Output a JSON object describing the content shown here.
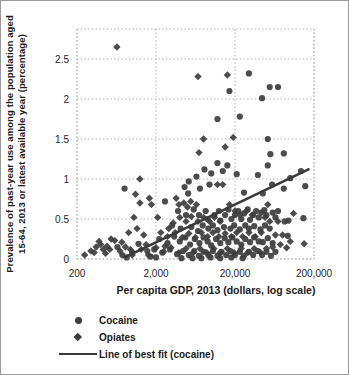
{
  "chart_data": {
    "type": "scatter",
    "title": "",
    "xlabel": "Per capita GDP, 2013 (dollars, log scale)",
    "ylabel_line1": "Prevalence of past-year use among the population aged",
    "ylabel_line2": "15-64, 2013 or latest available year (percentage)",
    "x_scale": "log",
    "xlim": [
      200,
      200000
    ],
    "ylim": [
      0,
      2.875
    ],
    "x_ticks": [
      200,
      2000,
      20000,
      200000
    ],
    "x_tick_labels": [
      "200",
      "2,000",
      "20,000",
      "200,000"
    ],
    "y_ticks": [
      0,
      0.5,
      1,
      1.5,
      2,
      2.5
    ],
    "y_tick_labels": [
      "0",
      "0.5",
      "1",
      "1.5",
      "2",
      "2.5"
    ],
    "grid": "dotted",
    "legend": [
      "Cocaine",
      "Opiates",
      "Line of best fit (cocaine)"
    ],
    "legend_position": "bottom-left",
    "colors": {
      "marker": "#3d3d3d",
      "grid": "#b3b3b3",
      "text": "#262626",
      "line": "#3a3a3a"
    },
    "best_fit_cocaine": {
      "x1": 800,
      "y1": 0.02,
      "x2": 170000,
      "y2": 1.12
    },
    "series": [
      {
        "name": "Cocaine",
        "marker": "circle",
        "points": [
          [
            17000,
            2.1
          ],
          [
            30000,
            2.32
          ],
          [
            44000,
            2.01
          ],
          [
            55000,
            2.15
          ],
          [
            70000,
            2.15
          ],
          [
            23000,
            1.78
          ],
          [
            12000,
            1.75
          ],
          [
            52000,
            1.5
          ],
          [
            56000,
            1.31
          ],
          [
            83000,
            1.32
          ],
          [
            52000,
            1.17
          ],
          [
            39000,
            1.05
          ],
          [
            21000,
            1.06
          ],
          [
            12000,
            1.2
          ],
          [
            16000,
            1.17
          ],
          [
            10000,
            1.07
          ],
          [
            6500,
            1.03
          ],
          [
            5200,
            0.97
          ],
          [
            8200,
            1.12
          ],
          [
            14000,
            1.1
          ],
          [
            100000,
            1.01
          ],
          [
            137000,
            1.1
          ],
          [
            155000,
            0.91
          ],
          [
            83000,
            0.88
          ],
          [
            95000,
            0.48
          ],
          [
            147000,
            0.51
          ],
          [
            93000,
            0.29
          ],
          [
            59000,
            0.93
          ],
          [
            45000,
            0.82
          ],
          [
            26000,
            0.83
          ],
          [
            800,
            0.88
          ],
          [
            4600,
            0.9
          ],
          [
            5100,
            0.82
          ],
          [
            7200,
            0.88
          ],
          [
            9500,
            0.93
          ],
          [
            85000,
            0.47
          ],
          [
            2600,
            0.72
          ],
          [
            3800,
            0.6
          ],
          [
            4800,
            0.55
          ],
          [
            6000,
            0.62
          ],
          [
            7000,
            0.55
          ],
          [
            8500,
            0.6
          ],
          [
            9000,
            0.5
          ],
          [
            11000,
            0.55
          ],
          [
            12500,
            0.6
          ],
          [
            13000,
            0.48
          ],
          [
            15000,
            0.55
          ],
          [
            16500,
            0.62
          ],
          [
            18000,
            0.5
          ],
          [
            20000,
            0.55
          ],
          [
            22000,
            0.6
          ],
          [
            24000,
            0.5
          ],
          [
            26000,
            0.57
          ],
          [
            29000,
            0.62
          ],
          [
            31000,
            0.49
          ],
          [
            34000,
            0.55
          ],
          [
            37000,
            0.6
          ],
          [
            40000,
            0.52
          ],
          [
            43000,
            0.58
          ],
          [
            47000,
            0.61
          ],
          [
            50000,
            0.55
          ],
          [
            60000,
            0.58
          ],
          [
            65000,
            0.52
          ],
          [
            70000,
            0.6
          ],
          [
            3200,
            0.42
          ],
          [
            4100,
            0.38
          ],
          [
            5600,
            0.4
          ],
          [
            6800,
            0.35
          ],
          [
            7800,
            0.42
          ],
          [
            9200,
            0.38
          ],
          [
            10500,
            0.42
          ],
          [
            12000,
            0.36
          ],
          [
            14500,
            0.4
          ],
          [
            17500,
            0.38
          ],
          [
            19500,
            0.42
          ],
          [
            23000,
            0.37
          ],
          [
            27000,
            0.42
          ],
          [
            30000,
            0.38
          ],
          [
            35000,
            0.41
          ],
          [
            42000,
            0.37
          ],
          [
            48000,
            0.42
          ],
          [
            55000,
            0.38
          ],
          [
            2200,
            0.25
          ],
          [
            2800,
            0.2
          ],
          [
            3400,
            0.28
          ],
          [
            4000,
            0.22
          ],
          [
            4700,
            0.27
          ],
          [
            5400,
            0.18
          ],
          [
            6200,
            0.25
          ],
          [
            7100,
            0.2
          ],
          [
            8000,
            0.27
          ],
          [
            9000,
            0.22
          ],
          [
            10000,
            0.17
          ],
          [
            11500,
            0.25
          ],
          [
            13000,
            0.2
          ],
          [
            14800,
            0.26
          ],
          [
            16500,
            0.21
          ],
          [
            18500,
            0.27
          ],
          [
            21000,
            0.22
          ],
          [
            24000,
            0.18
          ],
          [
            27000,
            0.25
          ],
          [
            31000,
            0.21
          ],
          [
            35000,
            0.27
          ],
          [
            40000,
            0.22
          ],
          [
            45000,
            0.21
          ],
          [
            52000,
            0.26
          ],
          [
            60000,
            0.2
          ],
          [
            1900,
            0.12
          ],
          [
            2400,
            0.08
          ],
          [
            3000,
            0.12
          ],
          [
            3700,
            0.06
          ],
          [
            4400,
            0.1
          ],
          [
            5200,
            0.05
          ],
          [
            6100,
            0.1
          ],
          [
            7000,
            0.04
          ],
          [
            8000,
            0.09
          ],
          [
            9200,
            0.05
          ],
          [
            10500,
            0.1
          ],
          [
            12000,
            0.04
          ],
          [
            13500,
            0.09
          ],
          [
            15500,
            0.05
          ],
          [
            17500,
            0.1
          ],
          [
            20000,
            0.05
          ],
          [
            23000,
            0.09
          ],
          [
            26000,
            0.04
          ],
          [
            30000,
            0.09
          ],
          [
            34000,
            0.05
          ],
          [
            39000,
            0.1
          ],
          [
            44000,
            0.05
          ],
          [
            50000,
            0.09
          ],
          [
            57000,
            0.04
          ],
          [
            65000,
            0.09
          ],
          [
            650,
            0.15
          ],
          [
            750,
            0.05
          ],
          [
            850,
            0.02
          ],
          [
            1000,
            0.08
          ],
          [
            1200,
            0.19
          ],
          [
            1550,
            0.1
          ],
          [
            1700,
            0.03
          ],
          [
            2000,
            0.02
          ],
          [
            4200,
            0.01
          ],
          [
            5800,
            0.01
          ],
          [
            7500,
            0.01
          ],
          [
            9800,
            0.02
          ],
          [
            13000,
            0.01
          ],
          [
            18000,
            0.02
          ],
          [
            25000,
            0.01
          ]
        ]
      },
      {
        "name": "Opiates",
        "marker": "diamond",
        "points": [
          [
            640,
            2.65
          ],
          [
            6800,
            2.28
          ],
          [
            16000,
            2.3
          ],
          [
            8000,
            1.5
          ],
          [
            19000,
            1.52
          ],
          [
            15000,
            1.4
          ],
          [
            7000,
            1.33
          ],
          [
            1250,
            1.0
          ],
          [
            12000,
            0.93
          ],
          [
            14000,
            0.93
          ],
          [
            110000,
            0.57
          ],
          [
            52000,
            0.68
          ],
          [
            150000,
            0.19
          ],
          [
            100000,
            0.22
          ],
          [
            70000,
            0.47
          ],
          [
            48000,
            0.52
          ],
          [
            55000,
            0.47
          ],
          [
            65000,
            0.3
          ],
          [
            80000,
            0.3
          ],
          [
            90000,
            0.14
          ],
          [
            75000,
            0.18
          ],
          [
            250,
            0.05
          ],
          [
            300,
            0.1
          ],
          [
            330,
            0.08
          ],
          [
            350,
            0.15
          ],
          [
            380,
            0.22
          ],
          [
            400,
            0.18
          ],
          [
            430,
            0.12
          ],
          [
            460,
            0.07
          ],
          [
            480,
            0.16
          ],
          [
            520,
            0.12
          ],
          [
            540,
            0.25
          ],
          [
            600,
            0.23
          ],
          [
            700,
            0.1
          ],
          [
            740,
            0.21
          ],
          [
            820,
            0.15
          ],
          [
            900,
            0.33
          ],
          [
            950,
            0.12
          ],
          [
            1000,
            0.05
          ],
          [
            1150,
            0.38
          ],
          [
            1300,
            0.12
          ],
          [
            1400,
            0.3
          ],
          [
            1500,
            0.18
          ],
          [
            1600,
            0.05
          ],
          [
            1100,
            0.81
          ],
          [
            1250,
            0.7
          ],
          [
            1050,
            0.52
          ],
          [
            1650,
            0.76
          ],
          [
            1750,
            0.68
          ],
          [
            2100,
            0.52
          ],
          [
            3600,
            0.76
          ],
          [
            3900,
            0.68
          ],
          [
            3300,
            0.45
          ],
          [
            4500,
            0.7
          ],
          [
            5000,
            0.65
          ],
          [
            5500,
            0.72
          ],
          [
            6500,
            0.68
          ],
          [
            4000,
            0.52
          ],
          [
            4800,
            0.47
          ],
          [
            5600,
            0.53
          ],
          [
            6800,
            0.47
          ],
          [
            8000,
            0.52
          ],
          [
            9500,
            0.47
          ],
          [
            11000,
            0.52
          ],
          [
            13000,
            0.47
          ],
          [
            17000,
            0.68
          ],
          [
            20000,
            0.6
          ],
          [
            23000,
            0.55
          ],
          [
            28000,
            0.6
          ],
          [
            33000,
            0.55
          ],
          [
            2300,
            0.33
          ],
          [
            2900,
            0.38
          ],
          [
            2800,
            0.28
          ],
          [
            3500,
            0.33
          ],
          [
            4300,
            0.27
          ],
          [
            5200,
            0.32
          ],
          [
            6300,
            0.27
          ],
          [
            7500,
            0.33
          ],
          [
            9000,
            0.28
          ],
          [
            10500,
            0.33
          ],
          [
            12500,
            0.28
          ],
          [
            15000,
            0.32
          ],
          [
            18000,
            0.28
          ],
          [
            21000,
            0.33
          ],
          [
            25000,
            0.28
          ],
          [
            30000,
            0.33
          ],
          [
            36000,
            0.28
          ],
          [
            43000,
            0.33
          ],
          [
            2000,
            0.14
          ],
          [
            2500,
            0.09
          ],
          [
            3100,
            0.14
          ],
          [
            3900,
            0.08
          ],
          [
            4800,
            0.13
          ],
          [
            5900,
            0.08
          ],
          [
            7200,
            0.13
          ],
          [
            8800,
            0.08
          ],
          [
            10800,
            0.13
          ],
          [
            13000,
            0.08
          ],
          [
            16000,
            0.13
          ],
          [
            19500,
            0.08
          ],
          [
            24000,
            0.13
          ],
          [
            29000,
            0.08
          ],
          [
            35000,
            0.13
          ],
          [
            42000,
            0.08
          ],
          [
            50000,
            0.13
          ],
          [
            60000,
            0.15
          ],
          [
            2600,
            0.16
          ]
        ]
      }
    ]
  }
}
